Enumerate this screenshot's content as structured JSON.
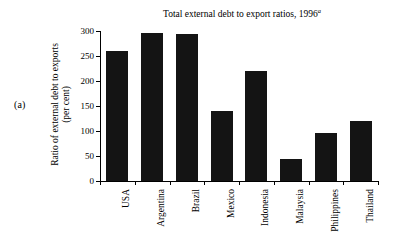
{
  "panel": {
    "label": "(a)"
  },
  "chart_data": {
    "type": "bar",
    "title": "Total external debt to export ratios, 1996",
    "title_superscript": "a",
    "xlabel": "",
    "ylabel": "Ratio of external debt to exports",
    "ylabel_unit": "(per cent)",
    "categories": [
      "USA",
      "Argentina",
      "Brazil",
      "Mexico",
      "Indonesia",
      "Malaysia",
      "Philippines",
      "Thailand"
    ],
    "values": [
      260,
      297,
      295,
      140,
      220,
      44,
      97,
      121
    ],
    "ylim": [
      0,
      300
    ],
    "yticks": [
      0,
      50,
      100,
      150,
      200,
      250,
      300
    ],
    "ytick_labels": [
      "0",
      "50",
      "100",
      "150",
      "200",
      "250",
      "300"
    ],
    "grid": false,
    "legend": false,
    "bar_color": "#141414"
  }
}
